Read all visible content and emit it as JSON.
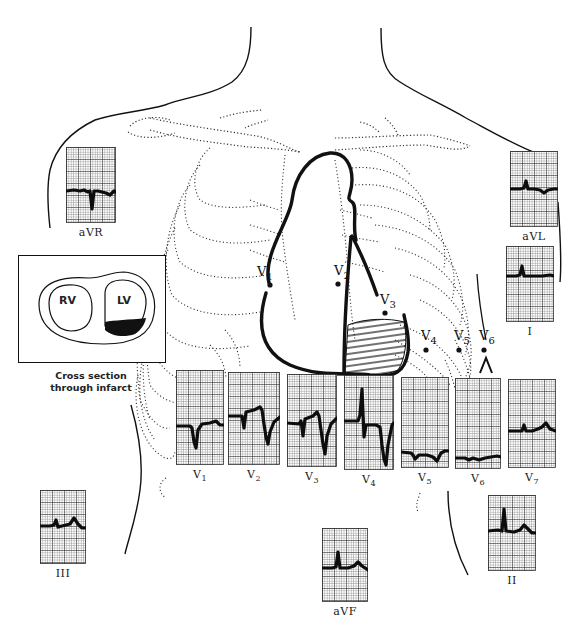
{
  "figure": {
    "inset": {
      "chambers": [
        {
          "label": "RV"
        },
        {
          "label": "LV"
        }
      ],
      "caption_line1": "Cross section",
      "caption_line2": "through infarct",
      "infarct_color": "#111111"
    },
    "electrodes": [
      {
        "id": "V1",
        "letter": "V",
        "sub": "1",
        "x": 268,
        "y": 287
      },
      {
        "id": "V2",
        "letter": "V",
        "sub": "2",
        "x": 339,
        "y": 285
      },
      {
        "id": "V3",
        "letter": "V",
        "sub": "3",
        "x": 384,
        "y": 313
      },
      {
        "id": "V4",
        "letter": "V",
        "sub": "4",
        "x": 426,
        "y": 350
      },
      {
        "id": "V5",
        "letter": "V",
        "sub": "5",
        "x": 459,
        "y": 350
      },
      {
        "id": "V6",
        "letter": "V",
        "sub": "6",
        "x": 484,
        "y": 350
      }
    ],
    "leads": [
      {
        "id": "aVR",
        "label": "aVR",
        "sub": "",
        "x": 66,
        "y": 147,
        "w": 50,
        "h": 76,
        "trace": "M0,44 L8,43 L14,44 L18,43 L22,45 L24,44 L26,62 L28,44 L32,44 L40,46 L44,48 L48,44 L50,45"
      },
      {
        "id": "aVL",
        "label": "aVL",
        "sub": "",
        "x": 510,
        "y": 151,
        "w": 48,
        "h": 76,
        "trace": "M0,38 L10,38 L14,37 L16,30 L18,38 L24,38 L30,39 L34,42 L38,39 L44,38 L48,38"
      },
      {
        "id": "I",
        "label": "I",
        "sub": "",
        "x": 506,
        "y": 246,
        "w": 48,
        "h": 76,
        "trace": "M0,30 L10,30 L14,29 L16,20 L18,30 L26,30 L36,30 L44,29 L48,30"
      },
      {
        "id": "V1",
        "label": "V",
        "sub": "1",
        "x": 176,
        "y": 370,
        "w": 48,
        "h": 95,
        "trace": "M0,56 L14,56 L16,58 L18,72 L20,78 L22,60 L26,54 L34,53 L40,51 L44,55 L48,55"
      },
      {
        "id": "V2",
        "label": "V",
        "sub": "2",
        "x": 228,
        "y": 372,
        "w": 52,
        "h": 93,
        "trace": "M0,44 L14,44 L16,56 L18,40 L26,38 L32,35 L34,38 L36,52 L38,65 L40,72 L42,60 L46,50 L52,45"
      },
      {
        "id": "V3",
        "label": "V",
        "sub": "3",
        "x": 287,
        "y": 374,
        "w": 50,
        "h": 93,
        "trace": "M0,49 L12,50 L14,47 L16,62 L18,45 L26,42 L30,38 L32,42 L34,56 L36,70 L38,80 L40,62 L44,50 L50,44"
      },
      {
        "id": "V4",
        "label": "V",
        "sub": "4",
        "x": 344,
        "y": 375,
        "w": 50,
        "h": 95,
        "trace": "M0,46 L14,46 L16,40 L18,14 L20,62 L22,50 L32,50 L36,52 L38,70 L40,84 L42,90 L44,70 L48,50 L50,48"
      },
      {
        "id": "V5",
        "label": "V",
        "sub": "5",
        "x": 401,
        "y": 377,
        "w": 48,
        "h": 91,
        "trace": "M0,75 L10,76 L12,78 L14,82 L18,78 L26,78 L32,80 L36,84 L40,76 L44,74 L48,74"
      },
      {
        "id": "V6",
        "label": "V",
        "sub": "6",
        "x": 455,
        "y": 378,
        "w": 46,
        "h": 91,
        "trace": "M0,80 L10,80 L14,82 L18,80 L24,82 L30,80 L36,79 L42,78 L46,79"
      },
      {
        "id": "V7",
        "label": "V",
        "sub": "7",
        "x": 508,
        "y": 379,
        "w": 48,
        "h": 89,
        "trace": "M0,52 L10,52 L14,52 L16,46 L18,52 L24,52 L30,50 L34,48 L38,44 L42,50 L48,52"
      },
      {
        "id": "III",
        "label": "III",
        "sub": "",
        "x": 40,
        "y": 490,
        "w": 46,
        "h": 74,
        "trace": "M0,36 L10,36 L14,35 L16,30 L18,37 L26,35 L30,34 L34,28 L38,34 L42,38 L46,38"
      },
      {
        "id": "aVF",
        "label": "aVF",
        "sub": "",
        "x": 322,
        "y": 528,
        "w": 46,
        "h": 74,
        "trace": "M0,40 L10,40 L14,39 L16,24 L18,40 L26,40 L32,38 L36,34 L40,38 L46,42"
      },
      {
        "id": "II",
        "label": "II",
        "sub": "",
        "x": 488,
        "y": 495,
        "w": 48,
        "h": 76,
        "trace": "M0,36 L10,35 L14,36 L16,14 L18,36 L26,37 L32,35 L36,30 L40,34 L44,38 L48,38"
      }
    ],
    "colors": {
      "grid_minor": "#555555",
      "grid_major": "#222222",
      "trace": "#0d0d0d",
      "anatomy_line": "#111111",
      "ribs_dotted": "#333333"
    }
  }
}
